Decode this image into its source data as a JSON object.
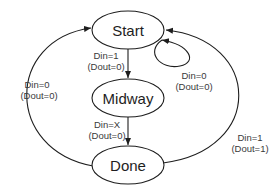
{
  "diagram": {
    "type": "state-machine",
    "states": [
      {
        "id": "start",
        "label": "Start"
      },
      {
        "id": "midway",
        "label": "Midway"
      },
      {
        "id": "done",
        "label": "Done"
      }
    ],
    "transitions": [
      {
        "from": "start",
        "to": "midway",
        "input": "Din=1",
        "output": "(Dout=0)"
      },
      {
        "from": "start",
        "to": "start",
        "input": "Din=0",
        "output": "(Dout=0)"
      },
      {
        "from": "midway",
        "to": "done",
        "input": "Din=X",
        "output": "(Dout=0)"
      },
      {
        "from": "done",
        "to": "start",
        "input": "Din=0",
        "output": "(Dout=0)",
        "side": "left"
      },
      {
        "from": "done",
        "to": "start",
        "input": "Din=1",
        "output": "(Dout=1)",
        "side": "right"
      }
    ]
  }
}
